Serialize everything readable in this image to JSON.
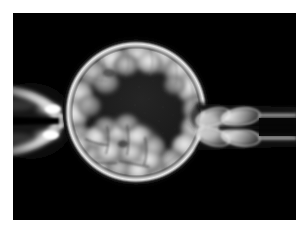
{
  "image": {
    "domain": "Natural-Image",
    "modality": "light-microscopy-grayscale",
    "subject": "mammalian blastocyst embryo during trophectoderm biopsy",
    "background_color": "#000000",
    "frame_color": "#ffffff",
    "frame_margin_px": 13,
    "micrograph_bounds": {
      "x": 13,
      "y": 13,
      "width": 283,
      "height": 207
    }
  },
  "structures": {
    "embryo": {
      "name": "blastocyst",
      "center": {
        "x": 136,
        "y": 112
      },
      "radius_px": 73,
      "zona_pellucida": {
        "name": "zona-pellucida",
        "description": "bright thin outer shell ring",
        "outer_radius_px": 73,
        "inner_radius_px": 66,
        "color": "#d8d8d8"
      },
      "trophectoderm": {
        "name": "trophectoderm-cells",
        "description": "ring of bright polygonal cells lining the inner surface of the zona",
        "cell_count_visible": 22,
        "color": "#c9c9c9"
      },
      "blastocoel": {
        "name": "blastocoel-cavity",
        "description": "large dark fluid-filled cavity occupying the centre and right of the embryo",
        "color": "#1d1d1d"
      },
      "inner_cell_mass": {
        "name": "inner-cell-mass",
        "description": "dense cluster of tightly packed cells in the lower-left quadrant",
        "center": {
          "x": 120,
          "y": 150
        },
        "width_px": 74,
        "height_px": 54,
        "cell_count_visible": 14,
        "color": "#cfcfcf"
      }
    },
    "holding_pipette": {
      "name": "holding-pipette",
      "side": "left",
      "description": "blunt suction pipette seen end-on as a bright lens with two specular highlights and a dark narrow bore",
      "bounds": {
        "x": 13,
        "y": 86,
        "width": 58,
        "height": 72
      },
      "bore_y": 121,
      "highlight_color": "#ffffff"
    },
    "biopsy_pipette": {
      "name": "biopsy-pipette",
      "side": "right",
      "description": "aspiration pipette drawing a string of trophectoderm cells out through a breach in the zona",
      "bounds": {
        "x": 200,
        "y": 96,
        "width": 96,
        "height": 48
      },
      "aspirated_cell_count": 4,
      "tube_color": "#9a9a9a"
    }
  },
  "palette": {
    "background": "#000000",
    "frame": "#ffffff",
    "cavity": "#1d1d1d",
    "cell_bright": "#e2e2e2",
    "cell_mid": "#9c9c9c",
    "cell_dark": "#5a5a5a",
    "zona": "#dadada",
    "highlight": "#ffffff"
  },
  "labels": {
    "title": "",
    "caption": "",
    "scale_bar": ""
  }
}
